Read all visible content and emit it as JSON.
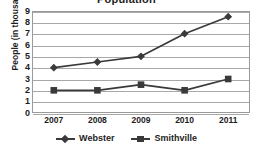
{
  "chart_data": {
    "type": "line",
    "title": "Population",
    "xlabel": "",
    "ylabel": "People (in thousands)",
    "categories": [
      "2007",
      "2008",
      "2009",
      "2010",
      "2011"
    ],
    "ylim": [
      0,
      9
    ],
    "yticks": [
      "0",
      "1",
      "2",
      "3",
      "4",
      "5",
      "6",
      "7",
      "8",
      "9"
    ],
    "grid": true,
    "legend_position": "bottom",
    "series": [
      {
        "name": "Webster",
        "marker": "diamond",
        "color": "#3a3a3a",
        "values": [
          4,
          4.5,
          5,
          7,
          8.5
        ]
      },
      {
        "name": "Smithville",
        "marker": "square",
        "color": "#3a3a3a",
        "values": [
          2,
          2,
          2.5,
          2,
          3
        ]
      }
    ]
  },
  "legend": {
    "items": [
      {
        "label": "Webster",
        "marker": "diamond"
      },
      {
        "label": "Smithville",
        "marker": "square"
      }
    ]
  },
  "colors": {
    "series": "#3a3a3a",
    "grid": "#a8a8a8",
    "frame": "#9a9a9a",
    "text": "#1d1d1d",
    "background": "#ffffff"
  }
}
